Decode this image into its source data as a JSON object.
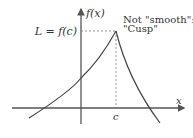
{
  "diagram": {
    "y_axis_label": "f(x)",
    "x_axis_label": "x",
    "peak_label": "L = f(c)",
    "point_label": "c",
    "annotation_line1": "Not \"smooth\":",
    "annotation_line2": "\"Cusp\"",
    "colors": {
      "axis": "#555555",
      "curve": "#444444",
      "dashed": "#777777",
      "text": "#333333"
    }
  }
}
